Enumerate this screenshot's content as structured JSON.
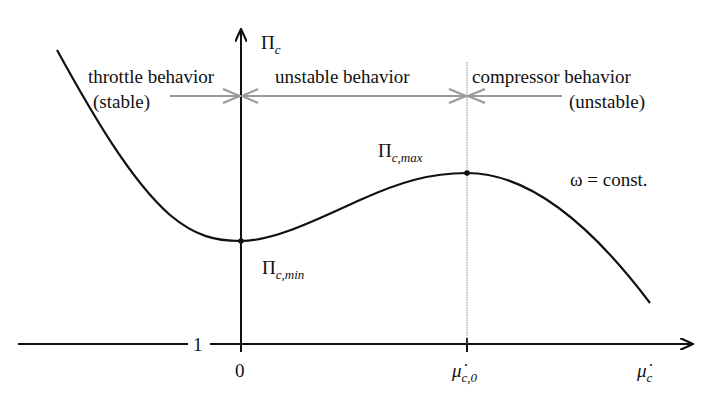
{
  "diagram": {
    "axes": {
      "y_label": "Πc",
      "y_label_main": "Π",
      "y_label_sub": "c",
      "x_label": "μ̇c",
      "x_label_main": "μ̇",
      "x_label_sub": "c",
      "y_tick": "1",
      "x_ticks": [
        {
          "label": "0"
        },
        {
          "label_main": "μ̇",
          "label_sub": "c,0",
          "label": "μ̇c,0"
        }
      ]
    },
    "regions": [
      {
        "line1": "throttle behavior",
        "line2": "(stable)"
      },
      {
        "line1": "unstable behavior"
      },
      {
        "line1": "compressor behavior",
        "line2": "(unstable)"
      }
    ],
    "points": [
      {
        "name": "minimum",
        "label_main": "Π",
        "label_sub": "c,min",
        "label": "Πc,min"
      },
      {
        "name": "maximum",
        "label_main": "Π",
        "label_sub": "c,max",
        "label": "Πc,max"
      }
    ],
    "curve_annotation": "ω = const.",
    "colors": {
      "curve": "#111111",
      "axes": "#111111",
      "region_arrows": "#9a9a9a",
      "dotted_line": "#8a8a8a",
      "background": "#ffffff"
    }
  }
}
